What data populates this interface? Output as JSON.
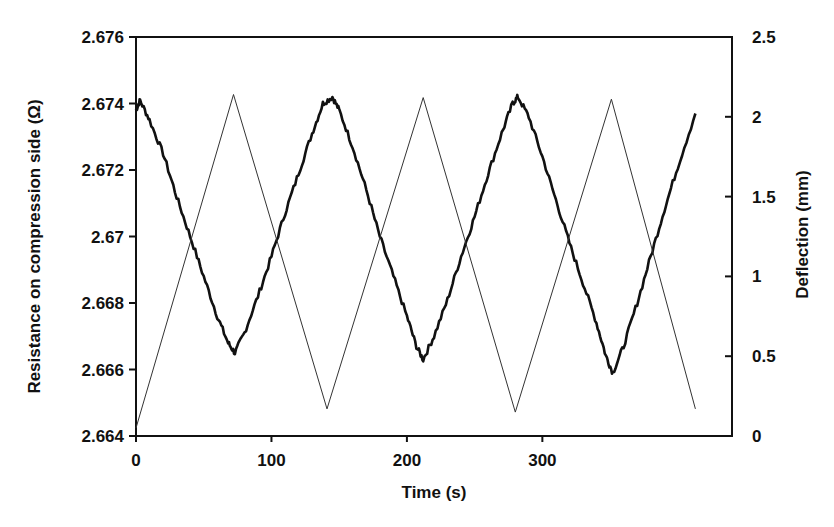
{
  "chart_data": {
    "type": "line",
    "title": "",
    "xlabel": "Time (s)",
    "ylabel": "Resistance on compression side (Ω)",
    "y2label": "Deflection (mm)",
    "xlim": [
      0,
      440
    ],
    "ylim": [
      2.664,
      2.676
    ],
    "y2lim": [
      0,
      2.5
    ],
    "grid": false,
    "legend": "none",
    "x_ticks": [
      "0",
      "100",
      "200",
      "300"
    ],
    "y_ticks": [
      "2.664",
      "2.666",
      "2.668",
      "2.67",
      "2.672",
      "2.674",
      "2.676"
    ],
    "y2_ticks": [
      "0",
      "0.5",
      "1",
      "1.5",
      "2",
      "2.5"
    ],
    "series": [
      {
        "name": "Resistance on compression side",
        "axis": "left",
        "style": "thick-noisy",
        "color": "#111111",
        "x": [
          0,
          3,
          10,
          20,
          30,
          40,
          50,
          60,
          68,
          73,
          80,
          90,
          100,
          110,
          120,
          130,
          138,
          145,
          150,
          160,
          170,
          180,
          190,
          200,
          207,
          212,
          220,
          230,
          240,
          250,
          260,
          270,
          278,
          282,
          290,
          300,
          310,
          320,
          330,
          340,
          347,
          352,
          360,
          370,
          380,
          390,
          400,
          413
        ],
        "values": [
          2.6738,
          2.6741,
          2.6735,
          2.6725,
          2.6712,
          2.67,
          2.6688,
          2.6676,
          2.6668,
          2.6665,
          2.6671,
          2.6682,
          2.6694,
          2.6707,
          2.6719,
          2.6731,
          2.674,
          2.6742,
          2.6738,
          2.6727,
          2.6714,
          2.67,
          2.6688,
          2.6676,
          2.6667,
          2.6663,
          2.667,
          2.6681,
          2.6694,
          2.6706,
          2.6719,
          2.6731,
          2.674,
          2.6742,
          2.6736,
          2.6724,
          2.6711,
          2.6698,
          2.6686,
          2.6674,
          2.6664,
          2.6659,
          2.6667,
          2.668,
          2.6694,
          2.6708,
          2.6721,
          2.6737
        ]
      },
      {
        "name": "Deflection",
        "axis": "right",
        "style": "thin",
        "color": "#333333",
        "x": [
          0,
          72,
          141,
          212,
          280,
          351,
          413
        ],
        "values": [
          0.05,
          2.14,
          0.17,
          2.12,
          0.15,
          2.11,
          0.17
        ]
      }
    ]
  }
}
